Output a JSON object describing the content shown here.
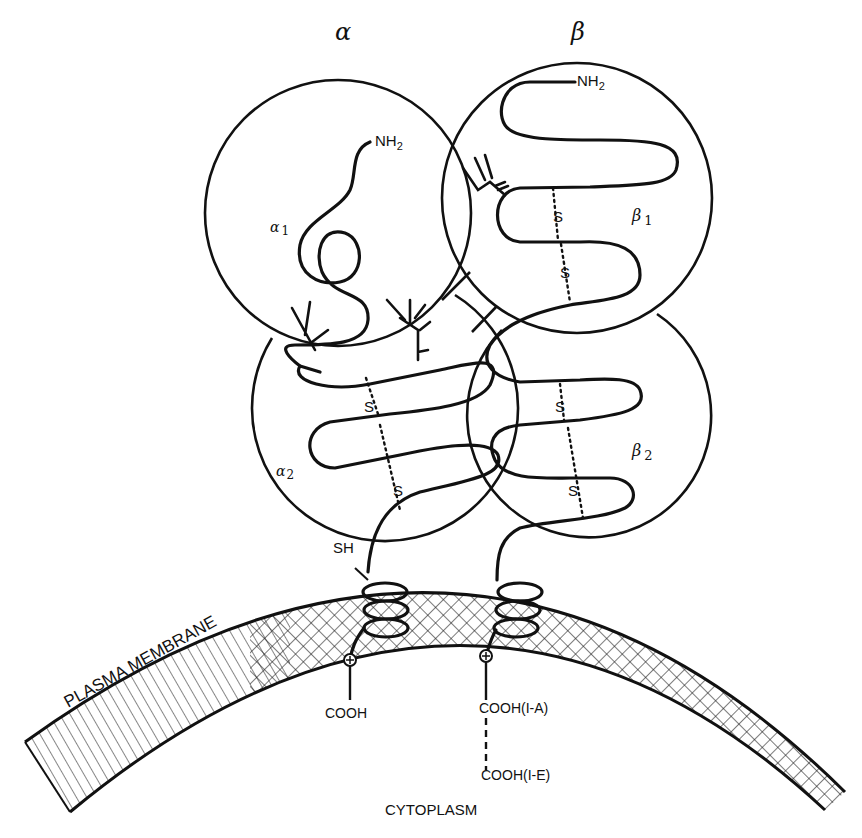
{
  "figure": {
    "subunits": {
      "alpha": {
        "label": "α",
        "x": 345,
        "y": 28
      },
      "beta": {
        "label": "β",
        "x": 580,
        "y": 28
      }
    },
    "domains": [
      {
        "id": "alpha1",
        "label": "α",
        "sub": "1",
        "cx": 338,
        "cy": 213,
        "r": 133
      },
      {
        "id": "alpha2",
        "label": "α",
        "sub": "2",
        "cx": 369,
        "cy": 450,
        "r": 133
      },
      {
        "id": "beta1",
        "label": "β",
        "sub": "1",
        "cx": 577,
        "cy": 198,
        "r": 135
      },
      {
        "id": "beta2",
        "label": "β",
        "sub": "2",
        "cx": 588,
        "cy": 440,
        "r": 122
      }
    ],
    "labels": {
      "alpha_nh2": "NH",
      "alpha_nh2_sub": "2",
      "beta_nh2": "NH",
      "beta_nh2_sub": "2",
      "alpha1": "α",
      "alpha1_sub": "1",
      "alpha2": "α",
      "alpha2_sub": "2",
      "beta1": "β",
      "beta1_sub": "1",
      "beta2": "β",
      "beta2_sub": "2",
      "disulfide": "S",
      "sh": "SH",
      "membrane": "PLASMA MEMBRANE",
      "cooh_alpha": "COOH",
      "cooh_beta_ia": "COOH(I-A)",
      "cooh_beta_ie": "COOH(I-E)",
      "cytoplasm": "CYTOPLASM"
    },
    "charge_symbol": "⊕",
    "colors": {
      "ink": "#111111",
      "background": "#ffffff"
    }
  }
}
